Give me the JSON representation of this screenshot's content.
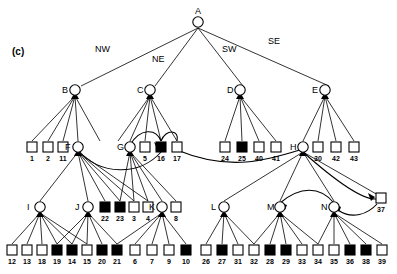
{
  "figure": {
    "panel_label": "(c)",
    "type": "tree-diagram",
    "colors": {
      "stroke": "#000000",
      "fill_open": "#ffffff",
      "fill_closed": "#000000"
    }
  },
  "direction_labels": [
    {
      "id": "NW",
      "text": "NW"
    },
    {
      "id": "NE",
      "text": "NE"
    },
    {
      "id": "SW",
      "text": "SW"
    },
    {
      "id": "SE",
      "text": "SE"
    }
  ],
  "internal_nodes": [
    {
      "id": "A",
      "label": "A",
      "x": 198,
      "y": 22
    },
    {
      "id": "B",
      "label": "B",
      "x": 75,
      "y": 90
    },
    {
      "id": "C",
      "label": "C",
      "x": 150,
      "y": 90
    },
    {
      "id": "D",
      "label": "D",
      "x": 240,
      "y": 90
    },
    {
      "id": "E",
      "label": "E",
      "x": 325,
      "y": 90
    },
    {
      "id": "F",
      "label": "F",
      "x": 78,
      "y": 147
    },
    {
      "id": "G",
      "label": "G",
      "x": 130,
      "y": 147
    },
    {
      "id": "H",
      "label": "H",
      "x": 303,
      "y": 147
    },
    {
      "id": "I",
      "label": "I",
      "x": 40,
      "y": 207
    },
    {
      "id": "J",
      "label": "J",
      "x": 88,
      "y": 207
    },
    {
      "id": "K",
      "label": "K",
      "x": 162,
      "y": 207
    },
    {
      "id": "L",
      "label": "L",
      "x": 224,
      "y": 207
    },
    {
      "id": "M",
      "label": "M",
      "x": 280,
      "y": 207
    },
    {
      "id": "N",
      "label": "N",
      "x": 334,
      "y": 207
    }
  ],
  "leaf_groups": [
    {
      "parent": "B",
      "row": "middle",
      "leaves": [
        {
          "label": "1",
          "filled": false,
          "x": 32,
          "y": 147
        },
        {
          "label": "2",
          "filled": false,
          "x": 48,
          "y": 147
        },
        {
          "label": "11",
          "filled": false,
          "x": 63,
          "y": 147
        }
      ]
    },
    {
      "parent": "C",
      "row": "middle",
      "leaves": [
        {
          "label": "5",
          "filled": false,
          "x": 145,
          "y": 147
        },
        {
          "label": "16",
          "filled": true,
          "x": 161,
          "y": 147
        },
        {
          "label": "17",
          "filled": false,
          "x": 177,
          "y": 147
        }
      ]
    },
    {
      "parent": "D",
      "row": "middle",
      "leaves": [
        {
          "label": "24",
          "filled": false,
          "x": 225,
          "y": 147
        },
        {
          "label": "25",
          "filled": true,
          "x": 242,
          "y": 147
        },
        {
          "label": "40",
          "filled": false,
          "x": 259,
          "y": 147
        },
        {
          "label": "41",
          "filled": false,
          "x": 276,
          "y": 147
        }
      ]
    },
    {
      "parent": "E",
      "row": "middle",
      "leaves": [
        {
          "label": "30",
          "filled": false,
          "x": 318,
          "y": 147
        },
        {
          "label": "42",
          "filled": false,
          "x": 336,
          "y": 147
        },
        {
          "label": "43",
          "filled": false,
          "x": 354,
          "y": 147
        }
      ]
    },
    {
      "parent": "F",
      "row": "lower-mid",
      "leaves": [
        {
          "label": "22",
          "filled": true,
          "x": 105,
          "y": 207
        },
        {
          "label": "23",
          "filled": true,
          "x": 120,
          "y": 207
        },
        {
          "label": "3",
          "filled": false,
          "x": 134,
          "y": 207
        },
        {
          "label": "4",
          "filled": false,
          "x": 148,
          "y": 207
        }
      ]
    },
    {
      "parent": "G",
      "row": "lower-mid",
      "leaves": [
        {
          "label": "8",
          "filled": false,
          "x": 176,
          "y": 207
        }
      ]
    },
    {
      "parent": "H",
      "row": "lower-mid",
      "leaves": [
        {
          "label": "37",
          "filled": false,
          "x": 381,
          "y": 198
        }
      ]
    },
    {
      "parent": "I",
      "row": "bottom",
      "leaves": [
        {
          "label": "12",
          "filled": false,
          "x": 12,
          "y": 250
        },
        {
          "label": "13",
          "filled": false,
          "x": 27,
          "y": 250
        },
        {
          "label": "18",
          "filled": false,
          "x": 42,
          "y": 250
        },
        {
          "label": "19",
          "filled": true,
          "x": 57,
          "y": 250
        }
      ]
    },
    {
      "parent": "J",
      "row": "bottom",
      "leaves": [
        {
          "label": "14",
          "filled": true,
          "x": 72,
          "y": 250
        },
        {
          "label": "15",
          "filled": false,
          "x": 87,
          "y": 250
        },
        {
          "label": "20",
          "filled": true,
          "x": 102,
          "y": 250
        },
        {
          "label": "21",
          "filled": true,
          "x": 117,
          "y": 250
        }
      ]
    },
    {
      "parent": "K",
      "row": "bottom",
      "leaves": [
        {
          "label": "6",
          "filled": false,
          "x": 135,
          "y": 250
        },
        {
          "label": "7",
          "filled": false,
          "x": 152,
          "y": 250
        },
        {
          "label": "9",
          "filled": false,
          "x": 169,
          "y": 250
        },
        {
          "label": "10",
          "filled": true,
          "x": 186,
          "y": 250
        }
      ]
    },
    {
      "parent": "L",
      "row": "bottom",
      "leaves": [
        {
          "label": "26",
          "filled": false,
          "x": 206,
          "y": 250
        },
        {
          "label": "27",
          "filled": true,
          "x": 222,
          "y": 250
        },
        {
          "label": "31",
          "filled": false,
          "x": 238,
          "y": 250
        },
        {
          "label": "32",
          "filled": false,
          "x": 254,
          "y": 250
        }
      ]
    },
    {
      "parent": "M",
      "row": "bottom",
      "leaves": [
        {
          "label": "28",
          "filled": true,
          "x": 270,
          "y": 250
        },
        {
          "label": "29",
          "filled": true,
          "x": 286,
          "y": 250
        },
        {
          "label": "33",
          "filled": false,
          "x": 302,
          "y": 250
        },
        {
          "label": "34",
          "filled": false,
          "x": 318,
          "y": 250
        }
      ]
    },
    {
      "parent": "N",
      "row": "bottom",
      "leaves": [
        {
          "label": "35",
          "filled": false,
          "x": 334,
          "y": 250
        },
        {
          "label": "36",
          "filled": true,
          "x": 350,
          "y": 250
        },
        {
          "label": "38",
          "filled": true,
          "x": 366,
          "y": 250
        },
        {
          "label": "39",
          "filled": false,
          "x": 382,
          "y": 250
        }
      ]
    }
  ]
}
